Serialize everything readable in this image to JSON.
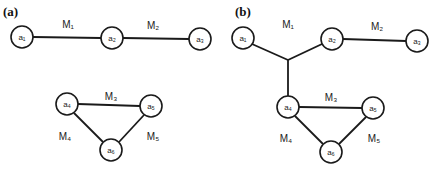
{
  "figure": {
    "panels": [
      {
        "label": "(a)",
        "nodes": [
          "a₁",
          "a₂",
          "a₃",
          "a₄",
          "a₅",
          "a₆"
        ],
        "edges": [
          {
            "label": "M₁",
            "connects": [
              "a₁",
              "a₂"
            ]
          },
          {
            "label": "M₂",
            "connects": [
              "a₂",
              "a₃"
            ]
          },
          {
            "label": "M₃",
            "connects": [
              "a₄",
              "a₅"
            ]
          },
          {
            "label": "M₄",
            "connects": [
              "a₄",
              "a₆"
            ]
          },
          {
            "label": "M₅",
            "connects": [
              "a₅",
              "a₆"
            ]
          }
        ]
      },
      {
        "label": "(b)",
        "nodes": [
          "a₁",
          "a₂",
          "a₃",
          "a₄",
          "a₅",
          "a₆"
        ],
        "edges": [
          {
            "label": "M₁",
            "connects": [
              "a₁",
              "a₂",
              "a₄"
            ]
          },
          {
            "label": "M₂",
            "connects": [
              "a₂",
              "a₃"
            ]
          },
          {
            "label": "M₃",
            "connects": [
              "a₄",
              "a₅"
            ]
          },
          {
            "label": "M₄",
            "connects": [
              "a₄",
              "a₆"
            ]
          },
          {
            "label": "M₅",
            "connects": [
              "a₅",
              "a₆"
            ]
          }
        ]
      }
    ]
  }
}
